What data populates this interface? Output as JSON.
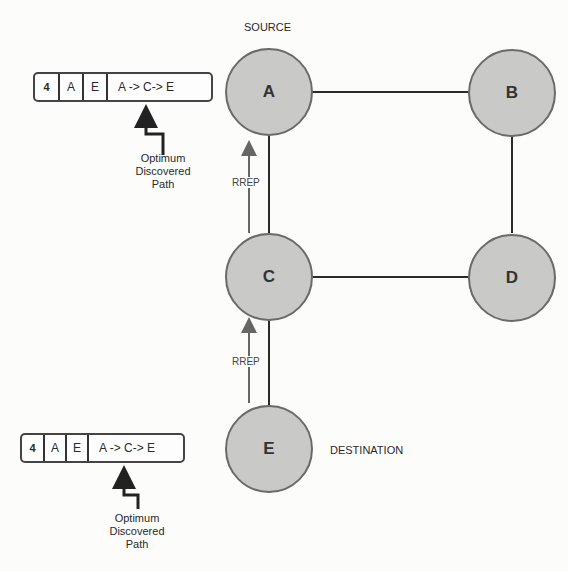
{
  "diagram": {
    "type": "network-route-reply",
    "nodes": [
      {
        "id": "A",
        "label": "A",
        "role": "SOURCE"
      },
      {
        "id": "B",
        "label": "B"
      },
      {
        "id": "C",
        "label": "C"
      },
      {
        "id": "D",
        "label": "D"
      },
      {
        "id": "E",
        "label": "E",
        "role": "DESTINATION"
      }
    ],
    "edges": [
      [
        "A",
        "B"
      ],
      [
        "B",
        "D"
      ],
      [
        "A",
        "C"
      ],
      [
        "C",
        "D"
      ],
      [
        "C",
        "E"
      ]
    ],
    "labels": {
      "source": "SOURCE",
      "destination": "DESTINATION"
    },
    "rrep_arrows": [
      {
        "label": "RREP",
        "from": "E",
        "to": "C"
      },
      {
        "label": "RREP",
        "from": "C",
        "to": "A"
      }
    ],
    "route_tables": [
      {
        "position": "top",
        "cells": [
          "4",
          "A",
          "E",
          "A -> C-> E"
        ],
        "note": [
          "Optimum",
          "Discovered",
          "Path"
        ]
      },
      {
        "position": "bottom",
        "cells": [
          "4",
          "A",
          "E",
          "A -> C-> E"
        ],
        "note": [
          "Optimum",
          "Discovered",
          "Path"
        ]
      }
    ],
    "colors": {
      "node_fill": "#c9c9c7",
      "node_border": "#6a6a6a",
      "edge": "#2a2a2a",
      "rrep_arrow": "#666666"
    }
  }
}
